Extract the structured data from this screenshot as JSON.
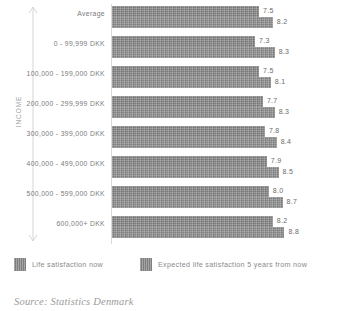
{
  "axis": {
    "income_label": "INCOME",
    "arrow_icon": "double-headed-up-down-arrow-icon"
  },
  "legend": {
    "items": [
      {
        "label": "Life satisfaction now",
        "swatch_color": "#8b8b8b",
        "icon": "legend-swatch-icon"
      },
      {
        "label": "Expected life satisfaction 5 years from now",
        "swatch_color": "#929292",
        "icon": "legend-swatch-icon"
      }
    ]
  },
  "source": "Source: Statistics Denmark",
  "chart_data": {
    "type": "bar",
    "orientation": "horizontal",
    "title": "",
    "xlabel": "",
    "ylabel": "INCOME",
    "grid": false,
    "legend_position": "bottom",
    "xlim": [
      0,
      10
    ],
    "categories": [
      "Average",
      "0 - 99,999 DKK",
      "100,000 - 199,000 DKK",
      "200,000 - 299,999 DKK",
      "300,000 - 399,000 DKK",
      "400,000 - 499,000 DKK",
      "500,000 - 599,000 DKK",
      "600,000+ DKK"
    ],
    "series": [
      {
        "name": "Life satisfaction now",
        "values": [
          7.5,
          7.3,
          7.5,
          7.7,
          7.8,
          7.9,
          8.0,
          8.2
        ],
        "labels": [
          "7.5",
          "7.3",
          "7.5",
          "7.7",
          "7.8",
          "7.9",
          "8.0",
          "8.2"
        ]
      },
      {
        "name": "Expected life satisfaction 5 years from now",
        "values": [
          8.2,
          8.3,
          8.1,
          8.3,
          8.4,
          8.5,
          8.7,
          8.8
        ],
        "labels": [
          "8.2",
          "8.3",
          "8.1",
          "8.3",
          "8.4",
          "8.5",
          "8.7",
          "8.8"
        ]
      }
    ]
  }
}
